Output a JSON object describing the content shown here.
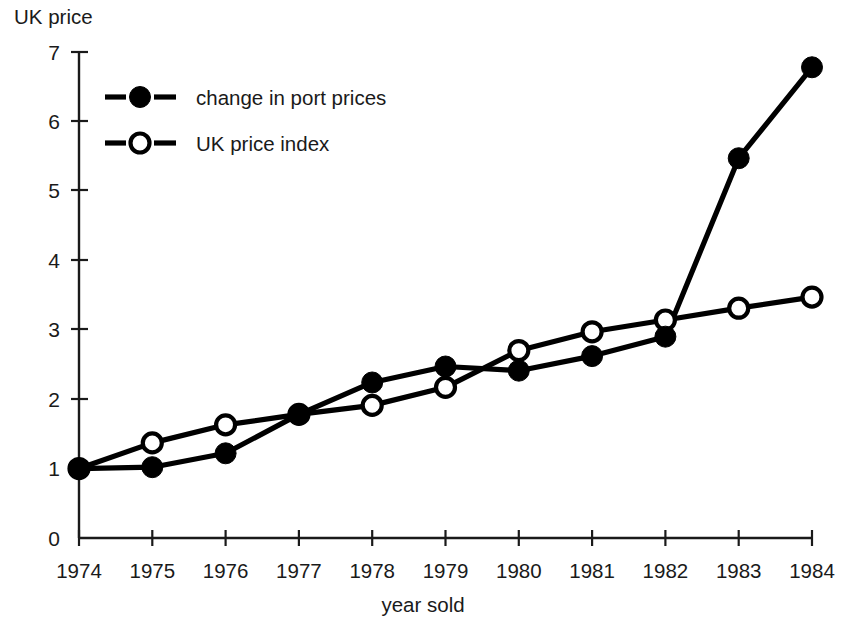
{
  "chart_data": {
    "type": "line",
    "title": "",
    "ylabel": "UK price",
    "xlabel": "year sold",
    "categories": [
      "1974",
      "1975",
      "1976",
      "1977",
      "1978",
      "1979",
      "1980",
      "1981",
      "1982",
      "1983",
      "1984"
    ],
    "x": [
      1974,
      1975,
      1976,
      1977,
      1978,
      1979,
      1980,
      1981,
      1982,
      1983,
      1984
    ],
    "series": [
      {
        "name": "change in port prices",
        "marker": "filled-circle",
        "color": "#000000",
        "values": [
          1.0,
          1.02,
          1.22,
          1.78,
          2.24,
          2.47,
          2.41,
          2.62,
          2.9,
          5.47,
          6.78
        ]
      },
      {
        "name": "UK price index",
        "marker": "open-circle",
        "color": "#000000",
        "values": [
          1.0,
          1.37,
          1.63,
          1.78,
          1.91,
          2.17,
          2.7,
          2.97,
          3.14,
          3.31,
          3.47
        ]
      }
    ],
    "ylim": [
      0,
      7
    ],
    "yticks": [
      0,
      1,
      2,
      3,
      4,
      5,
      6,
      7
    ],
    "ytick_labels": [
      "0",
      "1",
      "2",
      "3",
      "4",
      "5",
      "6",
      "7"
    ],
    "xlim": [
      1974,
      1984
    ],
    "grid": false,
    "legend_position": "upper-left-inside"
  },
  "legend": {
    "entries": [
      {
        "label": "change in port prices",
        "marker": "filled-circle"
      },
      {
        "label": "UK price index",
        "marker": "open-circle"
      }
    ]
  },
  "axes": {
    "y_title": "UK price",
    "x_title": "year sold"
  }
}
